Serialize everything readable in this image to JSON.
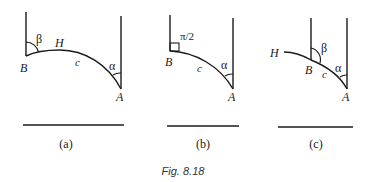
{
  "figure": {
    "caption": "Fig. 8.18",
    "colors": {
      "ink": "#1a1a1a",
      "background": "#ffffff"
    },
    "panels": [
      {
        "id": "a",
        "sublabel": "(a)",
        "points": {
          "B": "B",
          "A": "A",
          "H": "H"
        },
        "arc_label": "c",
        "angle_at_B": "β",
        "angle_at_A": "α"
      },
      {
        "id": "b",
        "sublabel": "(b)",
        "points": {
          "B": "B",
          "A": "A"
        },
        "arc_label": "c",
        "angle_at_B": "π/2",
        "angle_at_A": "α"
      },
      {
        "id": "c",
        "sublabel": "(c)",
        "points": {
          "B": "B",
          "A": "A",
          "H": "H"
        },
        "arc_label": "c",
        "angle_at_B": "β",
        "angle_at_A": "α"
      }
    ]
  }
}
